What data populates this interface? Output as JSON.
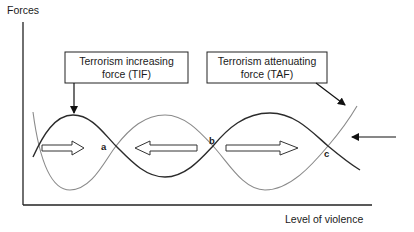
{
  "diagram": {
    "y_axis_label": "Forces",
    "x_axis_label": "Level of violence",
    "boxes": [
      {
        "id": "tif",
        "line1": "Terrorism increasing",
        "line2": "force (TIF)"
      },
      {
        "id": "taf",
        "line1": "Terrorism attenuating",
        "line2": "force (TAF)"
      }
    ],
    "points": {
      "a": "a",
      "b": "b",
      "c": "c"
    },
    "curves": [
      {
        "name": "TIF",
        "style": "dark solid",
        "color": "#2b2b2b"
      },
      {
        "name": "TAF",
        "style": "light solid",
        "color": "#8a8a8a"
      }
    ],
    "hollow_arrows": [
      {
        "direction": "right",
        "region": "left of a"
      },
      {
        "direction": "left",
        "region": "between a and b"
      },
      {
        "direction": "right",
        "region": "between b and c"
      }
    ],
    "external_arrow": {
      "direction": "left",
      "region": "right of c"
    }
  }
}
